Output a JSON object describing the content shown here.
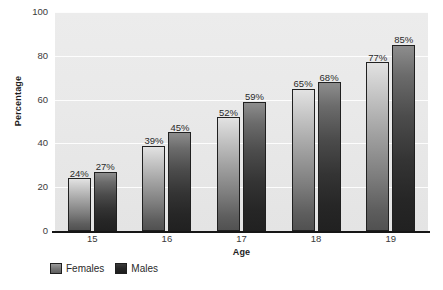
{
  "chart_data": {
    "type": "bar",
    "title": "",
    "subtitle": "",
    "xlabel": "Age",
    "ylabel": "Percentage",
    "categories": [
      "15",
      "16",
      "17",
      "18",
      "19"
    ],
    "series": [
      {
        "name": "Females",
        "values": [
          24,
          39,
          52,
          65,
          77
        ],
        "color": "#7d7d7d"
      },
      {
        "name": "Males",
        "values": [
          27,
          45,
          59,
          68,
          85
        ],
        "color": "#262626"
      }
    ],
    "value_labels": {
      "Females": [
        "24%",
        "39%",
        "52%",
        "65%",
        "77%"
      ],
      "Males": [
        "27%",
        "45%",
        "59%",
        "68%",
        "85%"
      ]
    },
    "ylim": [
      0,
      100
    ],
    "ytick_values": [
      0,
      20,
      40,
      60,
      80,
      100
    ],
    "ytick_labels": [
      "0",
      "20",
      "40",
      "60",
      "80",
      "100"
    ],
    "xtick_labels": [
      "15",
      "16",
      "17",
      "18",
      "19"
    ],
    "grid": "horizontal",
    "gridline_color": "#fdfdfd",
    "plot_background": "#e9e9e9",
    "figure_background": "#ffffff",
    "legend_position": "bottom-left",
    "legend_entries": [
      "Females",
      "Males"
    ],
    "value_label_suffix": "%"
  },
  "axis": {
    "y_title": "Percentage",
    "x_title": "Age"
  },
  "legend": {
    "items": [
      {
        "label": "Females",
        "swatch": "females-swatch"
      },
      {
        "label": "Males",
        "swatch": "males-swatch"
      }
    ]
  }
}
